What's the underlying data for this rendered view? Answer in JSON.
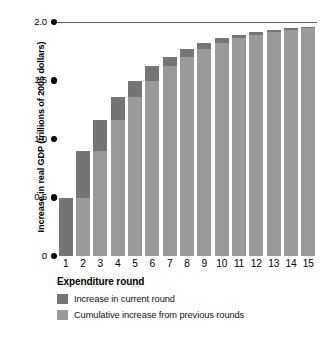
{
  "chart_data": {
    "type": "bar",
    "title": "",
    "subtitle": "",
    "xlabel": "Expenditure round",
    "ylabel": "Increase in real GDP (trillions of 2005 dollars)",
    "categories": [
      "1",
      "2",
      "3",
      "4",
      "5",
      "6",
      "7",
      "8",
      "9",
      "10",
      "11",
      "12",
      "13",
      "14",
      "15"
    ],
    "ylim": [
      0,
      2.0
    ],
    "ytick_values": [
      2.0,
      1.5,
      1.0,
      0.5,
      0
    ],
    "ytick_labels": [
      "2.0",
      "1.5",
      "1.0",
      "0.5",
      "0"
    ],
    "grid": false,
    "legend_position": "bottom-left",
    "stacked": true,
    "series": [
      {
        "name": "Cumulative increase from previous rounds",
        "color": "#9a9a9a",
        "values": [
          0,
          0.5,
          0.9,
          1.16,
          1.36,
          1.5,
          1.62,
          1.7,
          1.77,
          1.82,
          1.86,
          1.89,
          1.915,
          1.935,
          1.95
        ]
      },
      {
        "name": "Increase in current round",
        "color": "#757575",
        "values": [
          0.5,
          0.4,
          0.26,
          0.2,
          0.14,
          0.12,
          0.08,
          0.07,
          0.05,
          0.04,
          0.03,
          0.025,
          0.02,
          0.015,
          0.01
        ]
      }
    ],
    "totals": [
      0.5,
      0.9,
      1.16,
      1.36,
      1.5,
      1.62,
      1.7,
      1.77,
      1.82,
      1.86,
      1.89,
      1.915,
      1.935,
      1.95,
      1.96
    ],
    "annotations": [
      {
        "type": "horizontal-line",
        "value": 2.0,
        "label": ""
      }
    ]
  },
  "axes": {
    "y_title": "Increase in real GDP (trillions of 2005 dollars)",
    "x_title": "Expenditure round"
  },
  "legend": {
    "items": [
      {
        "label": "Increase in current round",
        "color": "#757575"
      },
      {
        "label": "Cumulative increase from previous rounds",
        "color": "#9a9a9a"
      }
    ]
  },
  "caption": {
    "partial_line": ""
  },
  "colors": {
    "current_round": "#757575",
    "cumulative": "#9a9a9a",
    "asymptote_line": "#5a5a5a",
    "text": "#000000",
    "background": "#ffffff"
  }
}
